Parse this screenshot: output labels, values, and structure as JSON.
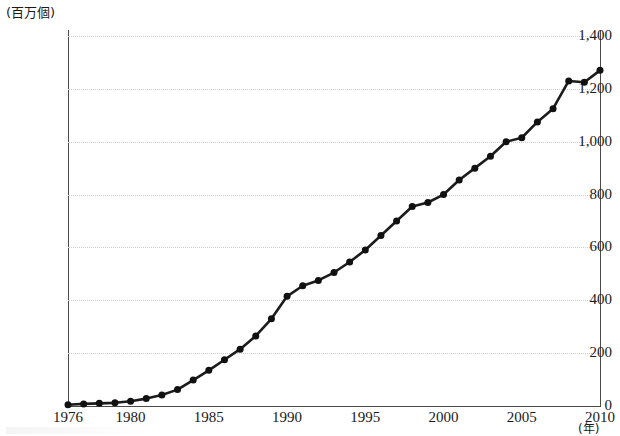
{
  "chart_data": {
    "type": "line",
    "title": "",
    "xlabel": "(年)",
    "ylabel": "(百万個)",
    "xlim": [
      1976,
      2010
    ],
    "ylim": [
      0,
      1400
    ],
    "grid": true,
    "legend": "none",
    "y_ticks": [
      "0",
      "200",
      "400",
      "600",
      "800",
      "1,000",
      "1,200",
      "1,400"
    ],
    "y_tick_values": [
      0,
      200,
      400,
      600,
      800,
      1000,
      1200,
      1400
    ],
    "x_ticks": [
      "1976",
      "1980",
      "1985",
      "1990",
      "1995",
      "2000",
      "2005",
      "2010"
    ],
    "x_tick_values": [
      1976,
      1980,
      1985,
      1990,
      1995,
      2000,
      2005,
      2010
    ],
    "x": [
      1976,
      1977,
      1978,
      1979,
      1980,
      1981,
      1982,
      1983,
      1984,
      1985,
      1986,
      1987,
      1988,
      1989,
      1990,
      1991,
      1992,
      1993,
      1994,
      1995,
      1996,
      1997,
      1998,
      1999,
      2000,
      2001,
      2002,
      2003,
      2004,
      2005,
      2006,
      2007,
      2008,
      2009,
      2010
    ],
    "values": [
      5,
      8,
      10,
      12,
      18,
      28,
      42,
      62,
      98,
      135,
      175,
      215,
      265,
      330,
      415,
      455,
      475,
      505,
      545,
      590,
      645,
      700,
      755,
      770,
      800,
      855,
      900,
      945,
      1000,
      1015,
      1075,
      1125,
      1230,
      1225,
      1270
    ],
    "series": [
      {
        "name": "",
        "values": [
          5,
          8,
          10,
          12,
          18,
          28,
          42,
          62,
          98,
          135,
          175,
          215,
          265,
          330,
          415,
          455,
          475,
          505,
          545,
          590,
          645,
          700,
          755,
          770,
          800,
          855,
          900,
          945,
          1000,
          1015,
          1075,
          1125,
          1230,
          1225,
          1270
        ],
        "marker": "filled-circle",
        "color": "#111111"
      }
    ]
  },
  "axes": {
    "y_unit_caption": "(百万個)",
    "x_unit_caption": "(年)"
  },
  "colors": {
    "line": "#1c1c1c",
    "marker": "#111111",
    "grid": "#cfcfcf",
    "axis": "#4a4a4a",
    "background": "#ffffff"
  }
}
